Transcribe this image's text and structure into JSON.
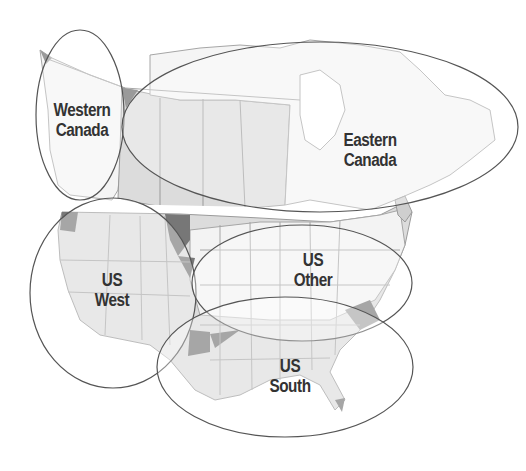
{
  "colors": {
    "background": "#ffffff",
    "land_light": "#f2f2f2",
    "land_mid": "#d9d9d9",
    "land_dark": "#7a7a7a",
    "border": "#a6a6a6",
    "ellipse_stroke": "#555555",
    "label": "#333333"
  },
  "regions": [
    {
      "id": "western-canada",
      "line1": "Western",
      "line2": "Canada"
    },
    {
      "id": "eastern-canada",
      "line1": "Eastern",
      "line2": "Canada"
    },
    {
      "id": "us-west",
      "line1": "US",
      "line2": "West"
    },
    {
      "id": "us-other",
      "line1": "US",
      "line2": "Other"
    },
    {
      "id": "us-south",
      "line1": "US",
      "line2": "South"
    }
  ]
}
